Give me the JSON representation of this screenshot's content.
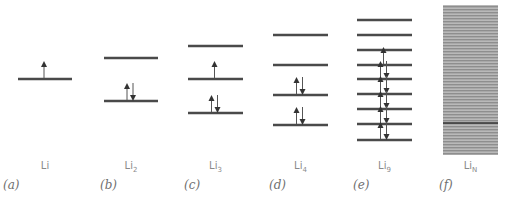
{
  "figure": {
    "type": "molecular orbital energy level diagram",
    "line_color": "#4a4a4a",
    "band_color": "#9a9a9a",
    "panels": [
      {
        "id": "a",
        "panel_label": "(a)",
        "species": "Li",
        "sub": "",
        "x": 18,
        "w": 54,
        "levels": [
          {
            "y": 79,
            "electrons": "up"
          }
        ]
      },
      {
        "id": "b",
        "panel_label": "(b)",
        "species": "Li",
        "sub": "2",
        "x": 104,
        "w": 54,
        "levels": [
          {
            "y": 58,
            "electrons": "none"
          },
          {
            "y": 101,
            "electrons": "pair"
          }
        ]
      },
      {
        "id": "c",
        "panel_label": "(c)",
        "species": "Li",
        "sub": "3",
        "x": 188,
        "w": 55,
        "levels": [
          {
            "y": 46,
            "electrons": "none"
          },
          {
            "y": 79,
            "electrons": "up"
          },
          {
            "y": 113,
            "electrons": "pair"
          }
        ]
      },
      {
        "id": "d",
        "panel_label": "(d)",
        "species": "Li",
        "sub": "4",
        "x": 273,
        "w": 55,
        "levels": [
          {
            "y": 35,
            "electrons": "none"
          },
          {
            "y": 65,
            "electrons": "none"
          },
          {
            "y": 95,
            "electrons": "pair"
          },
          {
            "y": 125,
            "electrons": "pair"
          }
        ]
      },
      {
        "id": "e",
        "panel_label": "(e)",
        "species": "Li",
        "sub": "9",
        "x": 357,
        "w": 55,
        "levels": [
          {
            "y": 20,
            "electrons": "none"
          },
          {
            "y": 35,
            "electrons": "none"
          },
          {
            "y": 50,
            "electrons": "none"
          },
          {
            "y": 65,
            "electrons": "up"
          },
          {
            "y": 79,
            "electrons": "pair"
          },
          {
            "y": 94,
            "electrons": "pair"
          },
          {
            "y": 109,
            "electrons": "pair"
          },
          {
            "y": 124,
            "electrons": "pair"
          },
          {
            "y": 140,
            "electrons": "pair"
          }
        ]
      },
      {
        "id": "f",
        "panel_label": "(f)",
        "species": "Li",
        "sub": "N",
        "x": 443,
        "w": 55,
        "band": {
          "top": 5,
          "bottom": 155,
          "fermi_y": 123
        }
      }
    ],
    "label_y": 160,
    "panel_label_y": 178
  }
}
